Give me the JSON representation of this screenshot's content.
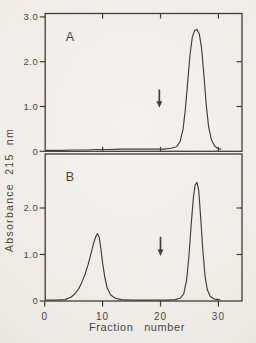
{
  "figure": {
    "kind": "scanned two-panel chromatogram figure",
    "xlabel": "Fraction number",
    "ylabel": "Absorbance 215 nm",
    "ink_color": "#413d39",
    "text_color": "#4b4641",
    "paper_color": "#efece8"
  },
  "chart_data": [
    {
      "panel": "A",
      "type": "line",
      "title": "",
      "xlabel": "Fraction number",
      "ylabel": "Absorbance 215 nm",
      "xlim": [
        0,
        34
      ],
      "ylim": [
        0,
        3.1
      ],
      "grid": false,
      "yticks": [
        0,
        1,
        2,
        3
      ],
      "ytick_labels": [
        "0",
        "1.0",
        "2.0",
        "3.0"
      ],
      "yticks_right": [
        1,
        2
      ],
      "xticks_top": [
        10,
        20,
        30
      ],
      "xticks_bottom": [],
      "xtick_labels": [],
      "series": [
        {
          "name": "absorbance-215nm-panel-A",
          "x": [
            0.3,
            3,
            5,
            7,
            9,
            11,
            13,
            15,
            17,
            19,
            20.5,
            21.8,
            22.8,
            23.4,
            23.9,
            24.3,
            24.7,
            25.1,
            25.5,
            25.9,
            26.3,
            26.7,
            27.1,
            27.5,
            27.9,
            28.3,
            28.8,
            29.4,
            30.0,
            30.4
          ],
          "y": [
            0.02,
            0.02,
            0.03,
            0.03,
            0.04,
            0.04,
            0.05,
            0.05,
            0.05,
            0.05,
            0.05,
            0.07,
            0.1,
            0.22,
            0.5,
            0.95,
            1.55,
            2.15,
            2.55,
            2.7,
            2.72,
            2.62,
            2.3,
            1.7,
            1.05,
            0.55,
            0.25,
            0.11,
            0.06,
            0.05
          ]
        }
      ],
      "peaks": [
        {
          "fraction": 26,
          "absorbance": 2.7
        }
      ],
      "annotations": [
        {
          "type": "down-arrow",
          "x": 19.8,
          "y_tail": 1.38,
          "y_tip": 0.97
        }
      ]
    },
    {
      "panel": "B",
      "type": "line",
      "title": "",
      "xlabel": "Fraction number",
      "ylabel": "Absorbance 215 nm",
      "xlim": [
        0,
        34
      ],
      "ylim": [
        0,
        3.2
      ],
      "grid": false,
      "yticks": [
        0,
        1,
        2
      ],
      "ytick_labels": [
        "0",
        "1.0",
        "2.0"
      ],
      "yticks_right": [
        1,
        2
      ],
      "xticks_top": [],
      "xticks_bottom": [
        0,
        10,
        20,
        30
      ],
      "xtick_labels": [
        "0",
        "10",
        "20",
        "30"
      ],
      "series": [
        {
          "name": "absorbance-215nm-panel-B",
          "x": [
            0.3,
            2,
            3.5,
            4.5,
            5.2,
            5.8,
            6.4,
            7.0,
            7.5,
            8.0,
            8.4,
            8.8,
            9.1,
            9.4,
            9.7,
            10.0,
            10.4,
            10.8,
            11.4,
            12.2,
            13.2,
            15,
            17,
            19,
            21,
            22.5,
            23.4,
            24.0,
            24.5,
            24.9,
            25.3,
            25.7,
            26.0,
            26.3,
            26.6,
            26.9,
            27.3,
            27.7,
            28.1,
            28.6,
            29.3,
            30.2
          ],
          "y": [
            0.02,
            0.02,
            0.03,
            0.08,
            0.15,
            0.25,
            0.4,
            0.58,
            0.78,
            1.02,
            1.22,
            1.38,
            1.45,
            1.38,
            1.12,
            0.82,
            0.5,
            0.28,
            0.13,
            0.06,
            0.03,
            0.02,
            0.02,
            0.02,
            0.02,
            0.03,
            0.06,
            0.15,
            0.45,
            0.95,
            1.65,
            2.25,
            2.5,
            2.55,
            2.38,
            1.85,
            1.1,
            0.52,
            0.24,
            0.1,
            0.04,
            0.03
          ]
        }
      ],
      "peaks": [
        {
          "fraction": 9,
          "absorbance": 1.45
        },
        {
          "fraction": 26,
          "absorbance": 2.55
        }
      ],
      "annotations": [
        {
          "type": "down-arrow",
          "x": 20,
          "y_tail": 1.38,
          "y_tip": 0.97
        }
      ]
    }
  ]
}
